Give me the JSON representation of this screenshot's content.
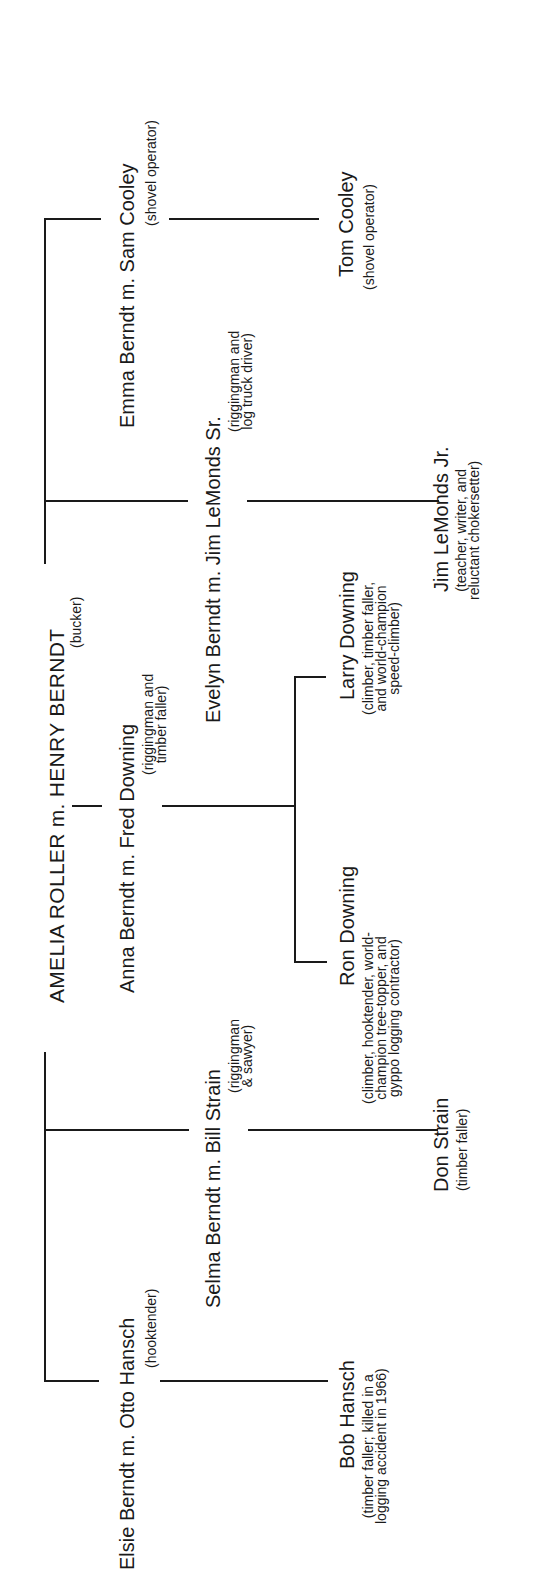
{
  "root": {
    "couple": "AMELIA ROLLER m. HENRY BERNDT",
    "occupation": "(bucker)"
  },
  "generation2": [
    {
      "couple": "Emma Berndt m. Sam Cooley",
      "occupation": [
        "(shovel operator)"
      ]
    },
    {
      "couple": "Evelyn Berndt m. Jim LeMonds Sr.",
      "occupation": [
        "(riggingman and",
        "log truck driver)"
      ]
    },
    {
      "couple": "Anna Berndt m. Fred Downing",
      "occupation": [
        "(riggingman and",
        "timber faller)"
      ]
    },
    {
      "couple": "Selma Berndt m. Bill Strain",
      "occupation": [
        "(riggingman",
        "& sawyer)"
      ]
    },
    {
      "couple": "Elsie Berndt m. Otto Hansch",
      "occupation": [
        "(hooktender)"
      ]
    }
  ],
  "generation3": [
    {
      "name": "Tom Cooley",
      "occupation": [
        "(shovel operator)"
      ]
    },
    {
      "name": "Jim LeMonds Jr.",
      "occupation": [
        "(teacher, writer, and",
        "reluctant chokersetter)"
      ]
    },
    {
      "name": "Larry Downing",
      "occupation": [
        "(climber, timber faller,",
        "and world-champion",
        "speed-climber)"
      ]
    },
    {
      "name": "Ron Downing",
      "occupation": [
        "(climber, hooktender, world-",
        "champion tree-topper, and",
        "gyppo logging contractor)"
      ]
    },
    {
      "name": "Don Strain",
      "occupation": [
        "(timber faller)"
      ]
    },
    {
      "name": "Bob Hansch",
      "occupation": [
        "(timber faller; killed in a",
        "logging accident in 1966)"
      ]
    }
  ]
}
